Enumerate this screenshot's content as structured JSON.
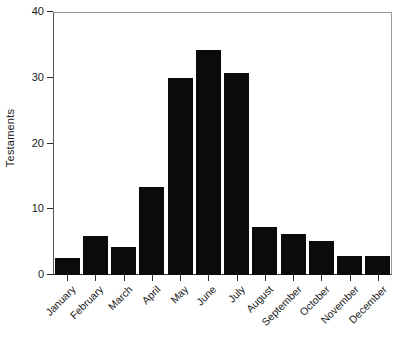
{
  "chart_data": {
    "type": "bar",
    "title": "",
    "xlabel": "",
    "ylabel": "Testaments",
    "categories": [
      "January",
      "February",
      "March",
      "April",
      "May",
      "June",
      "July",
      "August",
      "September",
      "October",
      "November",
      "December"
    ],
    "values": [
      2.6,
      6.0,
      4.3,
      13.4,
      30.0,
      34.2,
      30.7,
      7.3,
      6.2,
      5.1,
      2.9,
      2.9
    ],
    "ylim": [
      0,
      40
    ],
    "yticks": [
      0,
      10,
      20,
      30,
      40
    ],
    "ytick_labels": [
      "0",
      "10",
      "20",
      "30",
      "40"
    ],
    "grid": false,
    "legend": false,
    "bar_color": "#0b0b0b",
    "background_color": "#ffffff",
    "axis_color": "#2b2b2b",
    "frame_color": "#9a9a9a",
    "xtick_label_rotation": -45
  },
  "axes": {
    "y_title": "Testaments"
  }
}
